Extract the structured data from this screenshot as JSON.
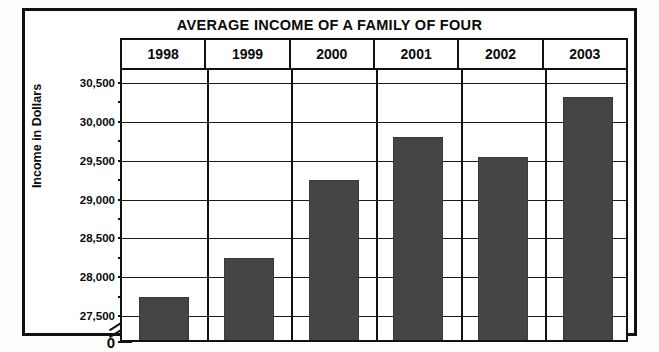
{
  "chart_data": {
    "type": "bar",
    "title": "AVERAGE INCOME OF A FAMILY OF FOUR",
    "xlabel": "",
    "ylabel": "Income in Dollars",
    "categories": [
      "1998",
      "1999",
      "2000",
      "2001",
      "2002",
      "2003"
    ],
    "values": [
      27750,
      28250,
      29250,
      29800,
      29550,
      30320
    ],
    "ylim": [
      27500,
      30500
    ],
    "y_axis_broken": true,
    "y_break_label": "0",
    "y_major_ticks": [
      27500,
      28000,
      28500,
      29000,
      29500,
      30000,
      30500
    ],
    "y_tick_labels": [
      "27,500",
      "28,000",
      "28,500",
      "29,000",
      "29,500",
      "30,000",
      "30,500"
    ],
    "y_minor_tick_interval": 250,
    "grid": true,
    "legend": false,
    "bar_color": "#454545",
    "line_color": "#111111",
    "background_color": "#ffffff"
  },
  "axis": {
    "zero_label": "0",
    "ticks": [
      {
        "value": 30500,
        "label": "30,500"
      },
      {
        "value": 30000,
        "label": "30,000"
      },
      {
        "value": 29500,
        "label": "29,500"
      },
      {
        "value": 29000,
        "label": "29,000"
      },
      {
        "value": 28500,
        "label": "28,500"
      },
      {
        "value": 28000,
        "label": "28,000"
      },
      {
        "value": 27500,
        "label": "27,500"
      }
    ]
  },
  "bars": [
    {
      "year": "1998",
      "value": 27750
    },
    {
      "year": "1999",
      "value": 28250
    },
    {
      "year": "2000",
      "value": 29250
    },
    {
      "year": "2001",
      "value": 29800
    },
    {
      "year": "2002",
      "value": 29550
    },
    {
      "year": "2003",
      "value": 30320
    }
  ]
}
